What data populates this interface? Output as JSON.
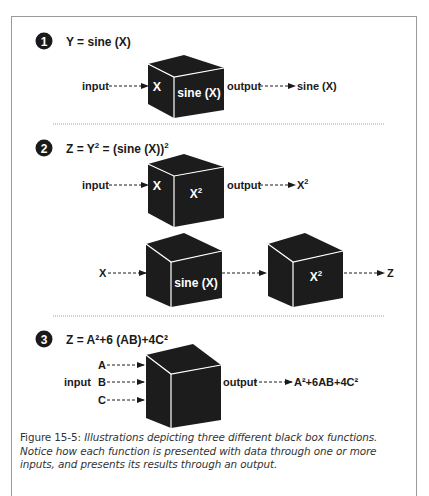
{
  "figure": {
    "sections": [
      {
        "number": "1",
        "equation": "Y = sine (X)",
        "rows": [
          {
            "input_label": "input",
            "cube_left_label": "X",
            "cube_front_label": "sine (X)",
            "output_label": "output",
            "result": "sine (X)"
          }
        ]
      },
      {
        "number": "2",
        "equation_base": "Z = Y",
        "equation_sup1": "2",
        "equation_mid": " = (sine (X))",
        "equation_sup2": "2",
        "rows": [
          {
            "input_label": "input",
            "cube_left_label": "X",
            "cube_front_label_base": "X",
            "cube_front_label_sup": "2",
            "output_label": "output",
            "result_base": "X",
            "result_sup": "2"
          },
          {
            "input_label": "X",
            "cube1_front_label": "sine (X)",
            "cube2_front_label_base": "X",
            "cube2_front_label_sup": "2",
            "result": "Z"
          }
        ]
      },
      {
        "number": "3",
        "equation": "Z = A²+6 (AB)+4C²",
        "rows": [
          {
            "group_label": "input",
            "inputs": [
              "A",
              "B",
              "C"
            ],
            "output_label": "output",
            "result": "A²+6AB+4C²"
          }
        ]
      }
    ],
    "caption": {
      "figure_label": "Figure 15-5:",
      "text": "Illustrations depicting three different black box functions. Notice how each function is presented with data through one or more inputs, and presents its results through an output."
    }
  },
  "colors": {
    "cube": "#1c1c1c",
    "cube_edge": "#ffffff",
    "frame": "#9a9a9a",
    "divider": "#8a8a8a",
    "text": "#1a1a1a"
  }
}
